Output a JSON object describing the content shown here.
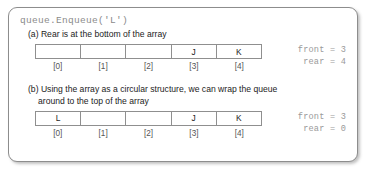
{
  "figure": {
    "code_title": "queue.Enqueue('L')",
    "panels": [
      {
        "caption_label": "(a)",
        "caption_text": "Rear is at the bottom of the array",
        "caption_cont": "",
        "cells": [
          "",
          "",
          "",
          "J",
          "K"
        ],
        "indices": [
          "[0]",
          "[1]",
          "[2]",
          "[3]",
          "[4]"
        ],
        "front_label": "front = 3",
        "rear_label": "rear = 4"
      },
      {
        "caption_label": "(b)",
        "caption_text": "Using the array as a circular structure, we can wrap the queue",
        "caption_cont": "around to the top of the array",
        "cells": [
          "L",
          "",
          "",
          "J",
          "K"
        ],
        "indices": [
          "[0]",
          "[1]",
          "[2]",
          "[3]",
          "[4]"
        ],
        "front_label": "front = 3",
        "rear_label": "rear = 0"
      }
    ]
  }
}
